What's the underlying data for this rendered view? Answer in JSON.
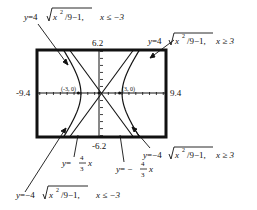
{
  "chart_data": {
    "type": "line",
    "title": "",
    "xlabel": "",
    "ylabel": "",
    "window": {
      "xmin": -9.4,
      "xmax": 9.4,
      "ymin": -6.2,
      "ymax": 6.2
    },
    "tick_labels": {
      "xmin": "-9.4",
      "xmax": "9.4",
      "ymax": "6.2",
      "ymin": "-6.2"
    },
    "points": [
      {
        "label": "(-3, 0)",
        "x": -3,
        "y": 0
      },
      {
        "label": "(3, 0)",
        "x": 3,
        "y": 0
      }
    ],
    "series": [
      {
        "name": "upper-left branch",
        "equation": "y = 4√(x²/9 − 1), x ≤ −3",
        "domain": [
          -9.4,
          -3
        ]
      },
      {
        "name": "upper-right branch",
        "equation": "y = 4√(x²/9 − 1), x ≥ 3",
        "domain": [
          3,
          9.4
        ]
      },
      {
        "name": "lower-right branch",
        "equation": "y = −4√(x²/9 − 1), x ≥ 3",
        "domain": [
          3,
          9.4
        ]
      },
      {
        "name": "lower-left branch",
        "equation": "y = −4√(x²/9 − 1), x ≤ −3",
        "domain": [
          -9.4,
          -3
        ]
      },
      {
        "name": "asymptote positive",
        "equation": "y = (4/3)x",
        "slope": 1.3333
      },
      {
        "name": "asymptote negative",
        "equation": "y = −(4/3)x",
        "slope": -1.3333
      }
    ],
    "grid": false,
    "axes_ticks": true
  },
  "labels": {
    "upper_left": {
      "y": "y",
      "eq": "=",
      "coef": "4",
      "rad": "x",
      "exp": "2",
      "rest": "/9−1,",
      "cond": "x ≤ −3"
    },
    "upper_right": {
      "y": "y",
      "eq": "=",
      "coef": "4",
      "rad": "x",
      "exp": "2",
      "rest": "/9−1,",
      "cond": "x ≥ 3"
    },
    "lower_right": {
      "y": "y",
      "eq": "=",
      "coef": "−4",
      "rad": "x",
      "exp": "2",
      "rest": "/9−1,",
      "cond": "x ≥ 3"
    },
    "lower_left": {
      "y": "y",
      "eq": "=",
      "coef": "−4",
      "rad": "x",
      "exp": "2",
      "rest": "/9−1,",
      "cond": "x ≤ −3"
    },
    "asym_pos": {
      "y": "y",
      "eq": "=",
      "num": "4",
      "den": "3",
      "x": "x"
    },
    "asym_neg": {
      "y": "y",
      "eq": "= −",
      "num": "4",
      "den": "3",
      "x": "x"
    }
  }
}
